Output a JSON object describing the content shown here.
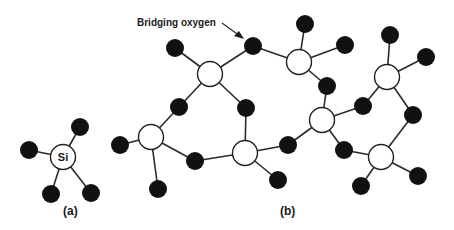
{
  "diagram": {
    "annotation": "Bridging oxygen",
    "label_a": "(a)",
    "label_b": "(b)",
    "si_symbol": "Si",
    "colors": {
      "oxygen": "#111111",
      "silicon_fill": "#ffffff",
      "bond": "#2a2a2a"
    },
    "tetrahedron_a": {
      "si": [
        63,
        157
      ],
      "oxygens": [
        [
          80,
          127
        ],
        [
          29,
          150
        ],
        [
          51,
          194
        ],
        [
          91,
          193
        ]
      ]
    },
    "network_b": {
      "silicons": [
        [
          151,
          137
        ],
        [
          210,
          74
        ],
        [
          245,
          153
        ],
        [
          299,
          62
        ],
        [
          322,
          120
        ],
        [
          381,
          157
        ],
        [
          387,
          77
        ]
      ],
      "oxygens": [
        [
          120,
          145
        ],
        [
          158,
          189
        ],
        [
          179,
          107
        ],
        [
          175,
          48
        ],
        [
          253,
          46
        ],
        [
          246,
          108
        ],
        [
          195,
          161
        ],
        [
          288,
          145
        ],
        [
          278,
          180
        ],
        [
          305,
          24
        ],
        [
          345,
          45
        ],
        [
          327,
          86
        ],
        [
          344,
          150
        ],
        [
          390,
          35
        ],
        [
          426,
          57
        ],
        [
          363,
          106
        ],
        [
          413,
          115
        ],
        [
          361,
          186
        ],
        [
          418,
          176
        ]
      ],
      "bonds": [
        [
          [
            151,
            137
          ],
          [
            120,
            145
          ]
        ],
        [
          [
            151,
            137
          ],
          [
            158,
            189
          ]
        ],
        [
          [
            151,
            137
          ],
          [
            179,
            107
          ]
        ],
        [
          [
            151,
            137
          ],
          [
            195,
            161
          ]
        ],
        [
          [
            210,
            74
          ],
          [
            179,
            107
          ]
        ],
        [
          [
            210,
            74
          ],
          [
            175,
            48
          ]
        ],
        [
          [
            210,
            74
          ],
          [
            253,
            46
          ]
        ],
        [
          [
            210,
            74
          ],
          [
            246,
            108
          ]
        ],
        [
          [
            245,
            153
          ],
          [
            246,
            108
          ]
        ],
        [
          [
            245,
            153
          ],
          [
            195,
            161
          ]
        ],
        [
          [
            245,
            153
          ],
          [
            288,
            145
          ]
        ],
        [
          [
            245,
            153
          ],
          [
            278,
            180
          ]
        ],
        [
          [
            299,
            62
          ],
          [
            253,
            46
          ]
        ],
        [
          [
            299,
            62
          ],
          [
            305,
            24
          ]
        ],
        [
          [
            299,
            62
          ],
          [
            345,
            45
          ]
        ],
        [
          [
            299,
            62
          ],
          [
            327,
            86
          ]
        ],
        [
          [
            322,
            120
          ],
          [
            327,
            86
          ]
        ],
        [
          [
            322,
            120
          ],
          [
            288,
            145
          ]
        ],
        [
          [
            322,
            120
          ],
          [
            344,
            150
          ]
        ],
        [
          [
            322,
            120
          ],
          [
            363,
            106
          ]
        ],
        [
          [
            387,
            77
          ],
          [
            363,
            106
          ]
        ],
        [
          [
            387,
            77
          ],
          [
            390,
            35
          ]
        ],
        [
          [
            387,
            77
          ],
          [
            426,
            57
          ]
        ],
        [
          [
            387,
            77
          ],
          [
            413,
            115
          ]
        ],
        [
          [
            381,
            157
          ],
          [
            413,
            115
          ]
        ],
        [
          [
            381,
            157
          ],
          [
            344,
            150
          ]
        ],
        [
          [
            381,
            157
          ],
          [
            361,
            186
          ]
        ],
        [
          [
            381,
            157
          ],
          [
            418,
            176
          ]
        ]
      ]
    }
  }
}
